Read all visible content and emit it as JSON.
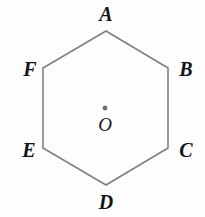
{
  "figure": {
    "type": "geometry-diagram",
    "shape_name": "regular-hexagon",
    "background_color": "#fdfdfd",
    "stroke_color": "#808080",
    "stroke_width": 1.6,
    "label_color": "#141414",
    "center_dot_color": "#6e6e6e",
    "polygon_points": "106,31 168,68 168,148 106,185 43,148 43,68",
    "vertices": [
      {
        "name": "A",
        "label": "A",
        "x": 106,
        "y": 31,
        "label_x": 106,
        "label_y": 14
      },
      {
        "name": "B",
        "label": "B",
        "x": 168,
        "y": 68,
        "label_x": 186,
        "label_y": 69
      },
      {
        "name": "C",
        "label": "C",
        "x": 168,
        "y": 148,
        "label_x": 186,
        "label_y": 150
      },
      {
        "name": "D",
        "label": "D",
        "x": 106,
        "y": 185,
        "label_x": 106,
        "label_y": 202
      },
      {
        "name": "E",
        "label": "E",
        "x": 43,
        "y": 148,
        "label_x": 29,
        "label_y": 150
      },
      {
        "name": "F",
        "label": "F",
        "x": 43,
        "y": 68,
        "label_x": 30,
        "label_y": 69
      }
    ],
    "center": {
      "name": "O",
      "label": "O",
      "x": 105,
      "y": 108,
      "dot_radius": 2.4,
      "label_x": 105,
      "label_y": 124
    }
  }
}
